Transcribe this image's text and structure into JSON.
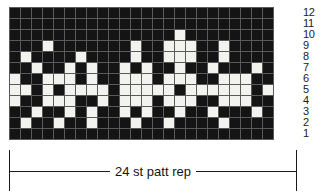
{
  "chart_data": {
    "type": "heatmap",
    "title": "",
    "xlabel": "",
    "ylabel": "",
    "legend_position": "none",
    "grid": true,
    "columns": 24,
    "rows": 12,
    "row_labels": [
      "12",
      "11",
      "10",
      "9",
      "8",
      "7",
      "6",
      "5",
      "4",
      "3",
      "2",
      "1"
    ],
    "value_legend": {
      "0": "main colour (dark)",
      "1": "contrast colour (light)"
    },
    "colors": {
      "dark": "#141414",
      "light": "#f2f2ee",
      "gridline": "#5a5a5a",
      "ink": "#1a1a1a",
      "background": "#ffffff"
    },
    "cells": [
      [
        0,
        0,
        0,
        0,
        0,
        0,
        0,
        0,
        0,
        0,
        0,
        0,
        0,
        0,
        0,
        0,
        0,
        0,
        0,
        0,
        0,
        0,
        0,
        0
      ],
      [
        0,
        0,
        0,
        0,
        0,
        0,
        0,
        0,
        0,
        0,
        0,
        0,
        0,
        0,
        0,
        0,
        0,
        0,
        0,
        0,
        0,
        0,
        0,
        0
      ],
      [
        0,
        0,
        0,
        0,
        0,
        0,
        0,
        0,
        0,
        0,
        0,
        0,
        0,
        0,
        0,
        1,
        0,
        0,
        0,
        0,
        0,
        0,
        0,
        0
      ],
      [
        0,
        0,
        0,
        1,
        0,
        0,
        0,
        0,
        0,
        0,
        0,
        1,
        0,
        0,
        1,
        1,
        1,
        0,
        0,
        1,
        0,
        0,
        0,
        0
      ],
      [
        0,
        1,
        0,
        0,
        0,
        0,
        1,
        0,
        0,
        0,
        0,
        1,
        0,
        0,
        1,
        1,
        1,
        0,
        0,
        1,
        0,
        0,
        0,
        0
      ],
      [
        0,
        0,
        1,
        0,
        0,
        1,
        0,
        1,
        0,
        0,
        1,
        0,
        1,
        0,
        0,
        1,
        0,
        0,
        1,
        0,
        0,
        0,
        1,
        0
      ],
      [
        1,
        0,
        0,
        1,
        1,
        1,
        0,
        1,
        0,
        0,
        1,
        1,
        1,
        0,
        1,
        1,
        1,
        0,
        0,
        1,
        1,
        1,
        0,
        0
      ],
      [
        1,
        1,
        0,
        1,
        0,
        1,
        1,
        1,
        1,
        0,
        1,
        1,
        1,
        1,
        1,
        0,
        1,
        1,
        1,
        1,
        1,
        1,
        0,
        1
      ],
      [
        1,
        0,
        0,
        1,
        1,
        1,
        0,
        0,
        1,
        0,
        1,
        1,
        1,
        0,
        1,
        1,
        1,
        0,
        0,
        1,
        1,
        1,
        0,
        0
      ],
      [
        0,
        0,
        1,
        0,
        0,
        1,
        0,
        1,
        0,
        0,
        1,
        0,
        1,
        0,
        0,
        1,
        0,
        0,
        1,
        0,
        0,
        0,
        1,
        0
      ],
      [
        0,
        1,
        0,
        0,
        1,
        0,
        0,
        1,
        0,
        0,
        0,
        1,
        0,
        0,
        1,
        0,
        0,
        0,
        0,
        1,
        0,
        0,
        0,
        0
      ],
      [
        0,
        0,
        0,
        0,
        0,
        0,
        0,
        0,
        0,
        0,
        0,
        0,
        0,
        0,
        0,
        0,
        0,
        0,
        0,
        0,
        0,
        0,
        0,
        0
      ]
    ]
  },
  "repeat": {
    "caption": "24 st patt rep"
  }
}
